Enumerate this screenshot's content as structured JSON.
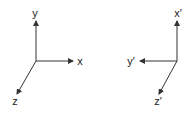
{
  "diagram": {
    "title": "",
    "colors": {
      "line": "#333333",
      "text": "#222222",
      "background": "#ffffff"
    },
    "frames": [
      {
        "name": "original-frame",
        "origin": [
          36,
          61
        ],
        "axes": [
          {
            "label": "y",
            "tip": [
              36,
              21
            ],
            "label_pos": [
              35,
              17
            ]
          },
          {
            "label": "x",
            "tip": [
              73,
              61
            ],
            "label_pos": [
              80,
              65
            ]
          },
          {
            "label": "z",
            "tip": [
              17,
              94
            ],
            "label_pos": [
              15,
              105
            ]
          }
        ]
      },
      {
        "name": "rotated-frame",
        "origin": [
          177,
          61
        ],
        "axes": [
          {
            "label": "x′",
            "tip": [
              177,
              21
            ],
            "label_pos": [
              178,
              17
            ]
          },
          {
            "label": "y′",
            "tip": [
              140,
              61
            ],
            "label_pos": [
              131,
              65
            ]
          },
          {
            "label": "z′",
            "tip": [
              159,
              94
            ],
            "label_pos": [
              158,
              105
            ]
          }
        ]
      }
    ]
  }
}
